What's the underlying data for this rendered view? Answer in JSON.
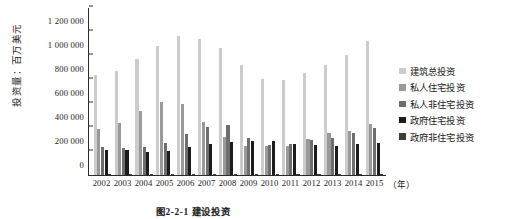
{
  "figure": {
    "caption": "图2-2-1  建设投资",
    "ylabel": "投资量：百万美元",
    "xunit": "（年）"
  },
  "legend": {
    "items": [
      {
        "label": "建筑总投资",
        "color": "#cccccc"
      },
      {
        "label": "私人住宅投资",
        "color": "#9a9a9a"
      },
      {
        "label": "私人非住宅投资",
        "color": "#6e6e6e"
      },
      {
        "label": "政府住宅投资",
        "color": "#1c1c1c"
      },
      {
        "label": "政府非住宅投资",
        "color": "#3d3d3d"
      }
    ]
  },
  "chart_data": {
    "type": "bar",
    "title": "图2-2-1  建设投资",
    "xlabel": "（年）",
    "ylabel": "投资量：百万美元",
    "ylim": [
      0,
      1400000
    ],
    "ytick_labels": [
      "0",
      "200 000",
      "400 000",
      "600 000",
      "800 000",
      "1 000 000",
      "1 200 000",
      "1 400 000"
    ],
    "ytick_values": [
      0,
      200000,
      400000,
      600000,
      800000,
      1000000,
      1200000,
      1400000
    ],
    "grid": false,
    "legend_position": "right",
    "categories": [
      "2002",
      "2003",
      "2004",
      "2005",
      "2006",
      "2007",
      "2008",
      "2009",
      "2010",
      "2011",
      "2012",
      "2013",
      "2014",
      "2015"
    ],
    "series": [
      {
        "name": "建筑总投资",
        "color": "#cccccc",
        "values": [
          830000,
          865000,
          965000,
          1075000,
          1160000,
          1135000,
          1060000,
          915000,
          800000,
          790000,
          850000,
          920000,
          1000000,
          1120000
        ]
      },
      {
        "name": "私人住宅投资",
        "color": "#9a9a9a",
        "values": [
          385000,
          430000,
          530000,
          605000,
          590000,
          445000,
          320000,
          245000,
          240000,
          245000,
          300000,
          350000,
          370000,
          425000
        ]
      },
      {
        "name": "私人非住宅投资",
        "color": "#6e6e6e",
        "values": [
          235000,
          225000,
          235000,
          265000,
          340000,
          400000,
          415000,
          310000,
          250000,
          260000,
          295000,
          310000,
          350000,
          390000
        ]
      },
      {
        "name": "政府住宅投资",
        "color": "#1c1c1c",
        "values": [
          205000,
          205000,
          195000,
          200000,
          235000,
          255000,
          275000,
          285000,
          280000,
          260000,
          250000,
          245000,
          255000,
          270000
        ]
      },
      {
        "name": "政府非住宅投资",
        "color": "#3d3d3d",
        "values": [
          6000,
          6000,
          6000,
          6000,
          7000,
          7000,
          8000,
          8000,
          8000,
          7000,
          6000,
          6000,
          6000,
          7000
        ]
      }
    ]
  }
}
